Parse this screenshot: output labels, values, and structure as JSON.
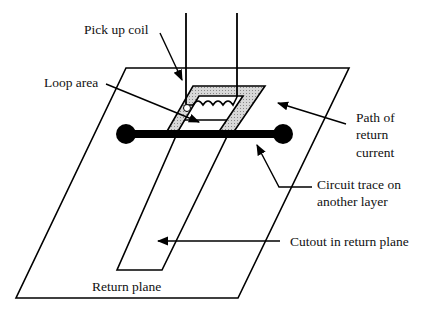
{
  "diagram": {
    "labels": {
      "pickup_coil": "Pick up coil",
      "loop_area": "Loop area",
      "path_line1": "Path of",
      "path_line2": "return",
      "path_line3": "current",
      "trace_line1": "Circuit trace on",
      "trace_line2": "another layer",
      "cutout": "Cutout in return plane",
      "return_plane": "Return plane"
    },
    "colors": {
      "line": "#000000",
      "hatch_fill": "#c8c8c8",
      "background": "#ffffff"
    }
  }
}
